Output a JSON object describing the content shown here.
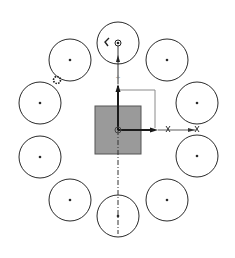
{
  "diagram": {
    "type": "circular-pattern-sketch",
    "colors": {
      "stroke": "#2a2a2a",
      "square_fill": "#9a9a9a",
      "square_stroke": "#555555",
      "box_stroke": "#8a8a8a",
      "axis": "#1a1a1a"
    },
    "center": {
      "x": 118,
      "y": 130
    },
    "square": {
      "x": 95,
      "y": 106,
      "w": 46,
      "h": 48
    },
    "outline_box": {
      "x1": 118,
      "y1": 90,
      "x2": 155,
      "y2": 128
    },
    "circle_radius": 21,
    "circles": [
      {
        "id": "top",
        "cx": 118,
        "cy": 43
      },
      {
        "id": "upper-right",
        "cx": 167,
        "cy": 60
      },
      {
        "id": "right-upper",
        "cx": 197,
        "cy": 103
      },
      {
        "id": "right-lower",
        "cx": 197,
        "cy": 156
      },
      {
        "id": "lower-right",
        "cx": 167,
        "cy": 200
      },
      {
        "id": "bottom",
        "cx": 118,
        "cy": 216
      },
      {
        "id": "lower-left",
        "cx": 70,
        "cy": 200
      },
      {
        "id": "left-lower",
        "cx": 40,
        "cy": 157
      },
      {
        "id": "left-upper",
        "cx": 40,
        "cy": 103
      },
      {
        "id": "upper-left",
        "cx": 70,
        "cy": 60
      }
    ],
    "markers": {
      "tangent_gear": {
        "cx": 57,
        "cy": 80
      },
      "angle_mark": {
        "x": 105,
        "y": 42
      },
      "x_mark_1": {
        "x": 168,
        "y": 129
      },
      "x_mark_2": {
        "x": 197,
        "y": 129
      }
    }
  }
}
